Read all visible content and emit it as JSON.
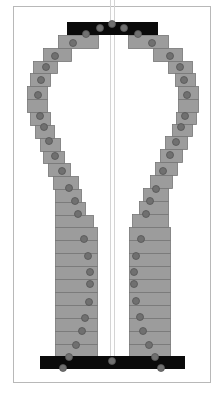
{
  "frame": {
    "x": 13,
    "y": 6,
    "w": 197,
    "h": 376,
    "stroke": "#b8b8b8"
  },
  "colors": {
    "block_fill": "#9c9c9c",
    "block_stroke": "#777777",
    "bar_fill": "#0a0a0a",
    "joint_fill": "#707070",
    "joint_stroke": "#555555",
    "center_line": "#d4d4d4"
  },
  "top_bar": {
    "x": 67,
    "y": 22,
    "w": 91,
    "h": 13
  },
  "bottom_bar": {
    "x": 40,
    "y": 356,
    "w": 145,
    "h": 13
  },
  "center_lines": [
    {
      "x": 110,
      "y1": 35,
      "y2": 356
    },
    {
      "x": 114,
      "y1": 35,
      "y2": 356
    }
  ],
  "left_blocks": [
    {
      "x": 58,
      "y": 35,
      "w": 40,
      "h": 13
    },
    {
      "x": 43,
      "y": 48,
      "w": 28,
      "h": 13
    },
    {
      "x": 33,
      "y": 61,
      "w": 24,
      "h": 12
    },
    {
      "x": 30,
      "y": 73,
      "w": 20,
      "h": 13
    },
    {
      "x": 27,
      "y": 86,
      "w": 20,
      "h": 13
    },
    {
      "x": 27,
      "y": 99,
      "w": 20,
      "h": 13
    },
    {
      "x": 30,
      "y": 112,
      "w": 20,
      "h": 13
    },
    {
      "x": 35,
      "y": 125,
      "w": 19,
      "h": 13
    },
    {
      "x": 40,
      "y": 138,
      "w": 20,
      "h": 13
    },
    {
      "x": 43,
      "y": 151,
      "w": 21,
      "h": 12
    },
    {
      "x": 48,
      "y": 163,
      "w": 22,
      "h": 13
    },
    {
      "x": 53,
      "y": 176,
      "w": 25,
      "h": 13
    },
    {
      "x": 55,
      "y": 189,
      "w": 26,
      "h": 13
    },
    {
      "x": 55,
      "y": 202,
      "w": 30,
      "h": 13
    },
    {
      "x": 55,
      "y": 215,
      "w": 38,
      "h": 12
    },
    {
      "x": 55,
      "y": 227,
      "w": 42,
      "h": 13
    },
    {
      "x": 55,
      "y": 240,
      "w": 42,
      "h": 13
    },
    {
      "x": 55,
      "y": 253,
      "w": 42,
      "h": 13
    },
    {
      "x": 55,
      "y": 266,
      "w": 42,
      "h": 13
    },
    {
      "x": 55,
      "y": 279,
      "w": 42,
      "h": 13
    },
    {
      "x": 55,
      "y": 292,
      "w": 42,
      "h": 13
    },
    {
      "x": 55,
      "y": 305,
      "w": 42,
      "h": 13
    },
    {
      "x": 55,
      "y": 318,
      "w": 42,
      "h": 13
    },
    {
      "x": 55,
      "y": 331,
      "w": 42,
      "h": 13
    },
    {
      "x": 55,
      "y": 344,
      "w": 42,
      "h": 12
    }
  ],
  "right_blocks": [
    {
      "x": 128,
      "y": 35,
      "w": 40,
      "h": 13
    },
    {
      "x": 153,
      "y": 48,
      "w": 29,
      "h": 13
    },
    {
      "x": 168,
      "y": 61,
      "w": 24,
      "h": 12
    },
    {
      "x": 175,
      "y": 73,
      "w": 20,
      "h": 13
    },
    {
      "x": 178,
      "y": 86,
      "w": 20,
      "h": 13
    },
    {
      "x": 178,
      "y": 99,
      "w": 20,
      "h": 13
    },
    {
      "x": 176,
      "y": 112,
      "w": 20,
      "h": 12
    },
    {
      "x": 172,
      "y": 124,
      "w": 20,
      "h": 12
    },
    {
      "x": 165,
      "y": 136,
      "w": 22,
      "h": 13
    },
    {
      "x": 160,
      "y": 149,
      "w": 22,
      "h": 13
    },
    {
      "x": 155,
      "y": 162,
      "w": 22,
      "h": 13
    },
    {
      "x": 150,
      "y": 175,
      "w": 22,
      "h": 13
    },
    {
      "x": 143,
      "y": 188,
      "w": 25,
      "h": 13
    },
    {
      "x": 139,
      "y": 201,
      "w": 29,
      "h": 13
    },
    {
      "x": 132,
      "y": 214,
      "w": 36,
      "h": 13
    },
    {
      "x": 129,
      "y": 227,
      "w": 41,
      "h": 13
    },
    {
      "x": 129,
      "y": 240,
      "w": 41,
      "h": 13
    },
    {
      "x": 129,
      "y": 253,
      "w": 41,
      "h": 13
    },
    {
      "x": 129,
      "y": 266,
      "w": 41,
      "h": 13
    },
    {
      "x": 129,
      "y": 279,
      "w": 41,
      "h": 13
    },
    {
      "x": 129,
      "y": 292,
      "w": 41,
      "h": 13
    },
    {
      "x": 129,
      "y": 305,
      "w": 41,
      "h": 13
    },
    {
      "x": 129,
      "y": 318,
      "w": 41,
      "h": 13
    },
    {
      "x": 129,
      "y": 331,
      "w": 41,
      "h": 13
    },
    {
      "x": 129,
      "y": 344,
      "w": 41,
      "h": 12
    }
  ],
  "joints": [
    {
      "x": 112,
      "y": 24,
      "r": 3.5
    },
    {
      "x": 100,
      "y": 28,
      "r": 3.5
    },
    {
      "x": 124,
      "y": 28,
      "r": 3.5
    },
    {
      "x": 86,
      "y": 34,
      "r": 3.5
    },
    {
      "x": 138,
      "y": 34,
      "r": 3.5
    },
    {
      "x": 73,
      "y": 43,
      "r": 3.5
    },
    {
      "x": 55,
      "y": 56,
      "r": 3.5
    },
    {
      "x": 46,
      "y": 67,
      "r": 3.5
    },
    {
      "x": 41,
      "y": 80,
      "r": 3.5
    },
    {
      "x": 38,
      "y": 95,
      "r": 3.5
    },
    {
      "x": 40,
      "y": 116,
      "r": 3.5
    },
    {
      "x": 44,
      "y": 127,
      "r": 3.5
    },
    {
      "x": 49,
      "y": 141,
      "r": 3.5
    },
    {
      "x": 55,
      "y": 156,
      "r": 3.5
    },
    {
      "x": 62,
      "y": 171,
      "r": 3.5
    },
    {
      "x": 69,
      "y": 188,
      "r": 3.5
    },
    {
      "x": 75,
      "y": 201,
      "r": 3.5
    },
    {
      "x": 78,
      "y": 214,
      "r": 3.5
    },
    {
      "x": 84,
      "y": 239,
      "r": 3.5
    },
    {
      "x": 88,
      "y": 256,
      "r": 3.5
    },
    {
      "x": 90,
      "y": 272,
      "r": 3.5
    },
    {
      "x": 90,
      "y": 284,
      "r": 3.5
    },
    {
      "x": 89,
      "y": 302,
      "r": 3.5
    },
    {
      "x": 85,
      "y": 318,
      "r": 3.5
    },
    {
      "x": 82,
      "y": 331,
      "r": 3.5
    },
    {
      "x": 76,
      "y": 345,
      "r": 3.5
    },
    {
      "x": 69,
      "y": 357,
      "r": 3.5
    },
    {
      "x": 63,
      "y": 368,
      "r": 3.5
    },
    {
      "x": 152,
      "y": 43,
      "r": 3.5
    },
    {
      "x": 170,
      "y": 56,
      "r": 3.5
    },
    {
      "x": 180,
      "y": 67,
      "r": 3.5
    },
    {
      "x": 184,
      "y": 80,
      "r": 3.5
    },
    {
      "x": 187,
      "y": 95,
      "r": 3.5
    },
    {
      "x": 185,
      "y": 116,
      "r": 3.5
    },
    {
      "x": 181,
      "y": 127,
      "r": 3.5
    },
    {
      "x": 176,
      "y": 142,
      "r": 3.5
    },
    {
      "x": 170,
      "y": 155,
      "r": 3.5
    },
    {
      "x": 163,
      "y": 171,
      "r": 3.5
    },
    {
      "x": 156,
      "y": 189,
      "r": 3.5
    },
    {
      "x": 150,
      "y": 201,
      "r": 3.5
    },
    {
      "x": 146,
      "y": 214,
      "r": 3.5
    },
    {
      "x": 141,
      "y": 239,
      "r": 3.5
    },
    {
      "x": 136,
      "y": 256,
      "r": 3.5
    },
    {
      "x": 134,
      "y": 272,
      "r": 3.5
    },
    {
      "x": 134,
      "y": 284,
      "r": 3.5
    },
    {
      "x": 136,
      "y": 301,
      "r": 3.5
    },
    {
      "x": 140,
      "y": 317,
      "r": 3.5
    },
    {
      "x": 143,
      "y": 331,
      "r": 3.5
    },
    {
      "x": 149,
      "y": 345,
      "r": 3.5
    },
    {
      "x": 155,
      "y": 357,
      "r": 3.5
    },
    {
      "x": 161,
      "y": 368,
      "r": 3.5
    },
    {
      "x": 112,
      "y": 361,
      "r": 3.5
    }
  ]
}
